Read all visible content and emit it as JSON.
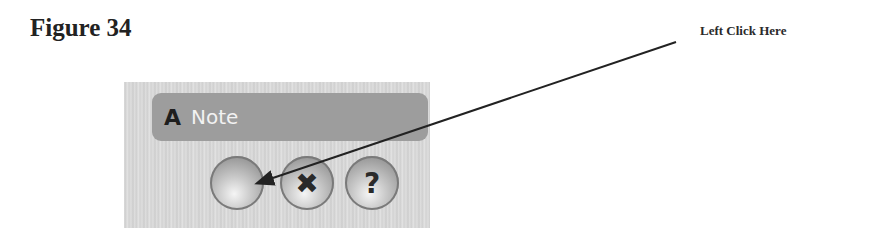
{
  "figure": {
    "title": "Figure 34"
  },
  "callout": {
    "text": "Left Click Here"
  },
  "dialog": {
    "title_icon": "A",
    "title": "Note",
    "buttons": [
      {
        "name": "ok",
        "glyph": "",
        "icon": "blank-orb-icon"
      },
      {
        "name": "cancel",
        "glyph": "✖",
        "icon": "x-icon"
      },
      {
        "name": "help",
        "glyph": "?",
        "icon": "question-icon"
      }
    ]
  },
  "arrow": {
    "from": [
      676,
      42
    ],
    "to": [
      255,
      184
    ],
    "color": "#222222"
  }
}
